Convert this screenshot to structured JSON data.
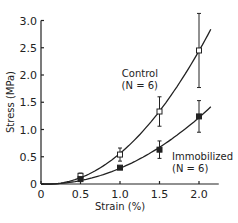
{
  "chart_data": {
    "type": "line",
    "title": "",
    "xlabel": "Strain (%)",
    "ylabel": "Stress (MPa)",
    "xlim": [
      0,
      2.25
    ],
    "ylim": [
      0,
      3.0
    ],
    "xticks": [
      "0",
      "0.5",
      "1.0",
      "1.5",
      "2.0"
    ],
    "yticks": [
      "0",
      "0.5",
      "1.0",
      "1.5",
      "2.0",
      "2.5",
      "3.0"
    ],
    "grid": false,
    "legend": "inline annotations",
    "series": [
      {
        "name": "Control (N = 6)",
        "marker": "open-square",
        "x": [
          0,
          0.5,
          1.0,
          1.5,
          2.0
        ],
        "values": [
          0,
          0.15,
          0.54,
          1.33,
          2.45
        ],
        "error": [
          0,
          0.05,
          0.12,
          0.27,
          0.68
        ]
      },
      {
        "name": "Immobilized (N = 6)",
        "marker": "filled-square",
        "x": [
          0,
          0.5,
          1.0,
          1.5,
          2.0
        ],
        "values": [
          0,
          0.09,
          0.3,
          0.63,
          1.24
        ],
        "error": [
          0,
          0.03,
          0.04,
          0.16,
          0.29
        ]
      }
    ],
    "annotations": [
      {
        "text": "Control",
        "line2": "(N = 6)"
      },
      {
        "text": "Immobilized",
        "line2": "(N = 6)"
      }
    ]
  }
}
